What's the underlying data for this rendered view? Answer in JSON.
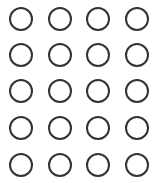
{
  "grid": {
    "rows": 5,
    "columns": 4,
    "stroke_color": "#333333",
    "background_color": "#ffffff",
    "column_centers_px": [
      21,
      60,
      98,
      137
    ],
    "row_centers_px": [
      19,
      55,
      91,
      128,
      165
    ],
    "diameter_px": 24,
    "cells": [
      [
        {
          "filled": false
        },
        {
          "filled": false
        },
        {
          "filled": false
        },
        {
          "filled": false
        }
      ],
      [
        {
          "filled": false
        },
        {
          "filled": false
        },
        {
          "filled": false
        },
        {
          "filled": false
        }
      ],
      [
        {
          "filled": false
        },
        {
          "filled": false
        },
        {
          "filled": false
        },
        {
          "filled": false
        }
      ],
      [
        {
          "filled": false
        },
        {
          "filled": false
        },
        {
          "filled": false
        },
        {
          "filled": false
        }
      ],
      [
        {
          "filled": false
        },
        {
          "filled": false
        },
        {
          "filled": false
        },
        {
          "filled": false
        }
      ]
    ]
  }
}
